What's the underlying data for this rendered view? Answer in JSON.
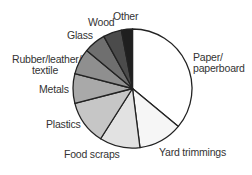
{
  "chart_data": {
    "type": "pie",
    "title": "",
    "start_angle_deg": 0,
    "direction": "clockwise",
    "categories": [
      "Paper/ paperboard",
      "Yard trimmings",
      "Food scraps",
      "Plastics",
      "Metals",
      "Rubber/leather/ textile",
      "Glass",
      "Wood",
      "Other"
    ],
    "values": [
      36,
      12,
      11,
      12,
      8,
      7,
      6,
      5,
      3
    ],
    "unit": "%",
    "colors": [
      "#ffffff",
      "#f6f6f6",
      "#e2e2e2",
      "#c6c6c6",
      "#a9a9a9",
      "#8f8f8f",
      "#6f6f6f",
      "#4b4b4b",
      "#1f1f1f"
    ],
    "legend": "none (labels placed around pie)"
  },
  "labels": {
    "paper_1": "Paper/",
    "paper_2": "paperboard",
    "yard": "Yard trimmings",
    "food": "Food scraps",
    "plastics": "Plastics",
    "metals": "Metals",
    "rubber_1": "Rubber/leather/",
    "rubber_2": "textile",
    "glass": "Glass",
    "wood": "Wood",
    "other": "Other"
  }
}
